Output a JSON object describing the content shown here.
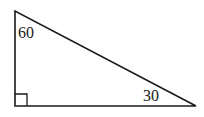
{
  "diagram": {
    "type": "right-triangle",
    "vertices": {
      "top": [
        15,
        11
      ],
      "right_angle": [
        15,
        106
      ],
      "right": [
        196,
        106
      ]
    },
    "right_angle_marker": true,
    "angles": {
      "top_label": "60",
      "right_label": "30"
    },
    "stroke_color": "#1a1a1a",
    "background": "#ffffff"
  }
}
